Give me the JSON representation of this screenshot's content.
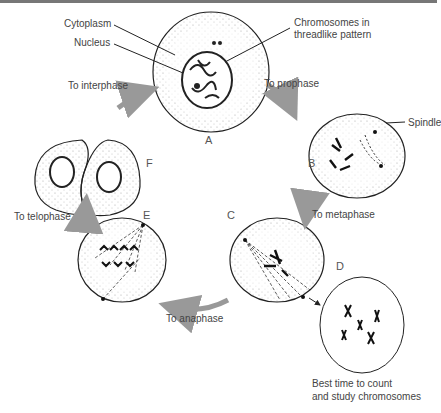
{
  "diagram": {
    "labels": {
      "cytoplasm": "Cytoplasm",
      "nucleus": "Nucleus",
      "chromosomes_1": "Chromosomes in",
      "chromosomes_2": "threadlike pattern",
      "spindle": "Spindle",
      "to_prophase": "To prophase",
      "to_metaphase": "To metaphase",
      "to_anaphase": "To anaphase",
      "to_telophase": "To telophase",
      "to_interphase": "To interphase",
      "best_1": "Best time to count",
      "best_2": "and study chromosomes"
    },
    "stages": {
      "a": "A",
      "b": "B",
      "c": "C",
      "d": "D",
      "e": "E",
      "f": "F"
    },
    "colors": {
      "arrow": "#999999",
      "outline": "#222222",
      "text": "#444444"
    }
  }
}
